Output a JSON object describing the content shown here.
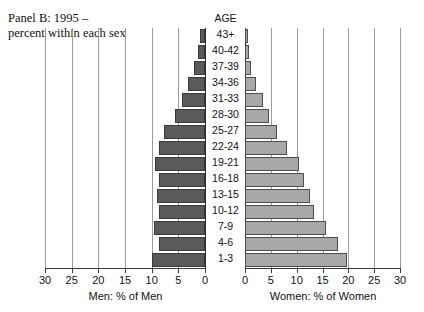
{
  "title": "Panel B: 1995 –\npercent within each sex",
  "age_header": "AGE",
  "axis": {
    "men_caption": "Men: % of Men",
    "women_caption": "Women: % of Women",
    "men_ticks": [
      "30",
      "25",
      "20",
      "15",
      "10",
      "5",
      "0"
    ],
    "women_ticks": [
      "0",
      "5",
      "10",
      "15",
      "20",
      "25",
      "30"
    ]
  },
  "colors": {
    "men_bar": "#5a5a5a",
    "women_bar": "#a8a8a8",
    "gridline": "#9a9a9a",
    "axis": "#3a3a3a"
  },
  "chart_data": {
    "type": "bar",
    "title": "Panel B: 1995 – percent within each sex",
    "subtitle": "",
    "orientation": "horizontal",
    "layout": "population-pyramid",
    "xlabel": "",
    "ylabel": "AGE",
    "xlim": [
      0,
      30
    ],
    "grid": true,
    "grid_interval": 5,
    "legend": "none",
    "categories": [
      "43+",
      "40-42",
      "37-39",
      "34-36",
      "31-33",
      "28-30",
      "25-27",
      "22-24",
      "19-21",
      "16-18",
      "13-15",
      "10-12",
      "7-9",
      "4-6",
      "1-3"
    ],
    "series": [
      {
        "name": "Men: % of Men",
        "direction": "left",
        "color": "#5a5a5a",
        "axis_ticks": [
          30,
          25,
          20,
          15,
          10,
          5,
          0
        ],
        "values": [
          1.0,
          1.4,
          2.0,
          3.2,
          4.4,
          5.6,
          7.6,
          8.6,
          9.3,
          8.6,
          9.0,
          8.6,
          9.6,
          8.6,
          10.0
        ]
      },
      {
        "name": "Women: % of Women",
        "direction": "right",
        "color": "#a8a8a8",
        "axis_ticks": [
          0,
          5,
          10,
          15,
          20,
          25,
          30
        ],
        "values": [
          0.6,
          0.8,
          1.2,
          2.2,
          3.4,
          4.6,
          6.2,
          8.2,
          10.4,
          11.4,
          12.6,
          13.4,
          15.6,
          18.0,
          19.8
        ]
      }
    ]
  }
}
